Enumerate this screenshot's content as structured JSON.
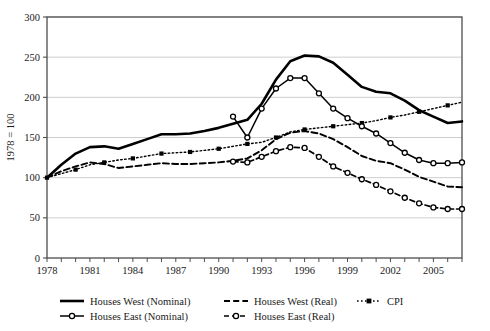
{
  "chart_data": {
    "type": "line",
    "title": "",
    "xlabel": "",
    "ylabel": "1978 = 100",
    "ylim": [
      0,
      300
    ],
    "xlim": [
      1978,
      2007
    ],
    "yticks": [
      0,
      50,
      100,
      150,
      200,
      250,
      300
    ],
    "xticks": [
      1978,
      1981,
      1984,
      1987,
      1990,
      1993,
      1996,
      1999,
      2002,
      2005
    ],
    "xtick_labels": [
      "1978",
      "1981",
      "1984",
      "1987",
      "1990",
      "1993",
      "1996",
      "1999",
      "2002",
      "2005"
    ],
    "ytick_labels": [
      "0",
      "50",
      "100",
      "150",
      "200",
      "250",
      "300"
    ],
    "grid": "horizontal",
    "legend_position": "bottom",
    "series": [
      {
        "name": "Houses West (Nominal)",
        "style": "solid-thick",
        "marker": "none",
        "color": "#000000",
        "x": [
          1978,
          1979,
          1980,
          1981,
          1982,
          1983,
          1984,
          1985,
          1986,
          1987,
          1988,
          1989,
          1990,
          1991,
          1992,
          1993,
          1994,
          1995,
          1996,
          1997,
          1998,
          1999,
          2000,
          2001,
          2002,
          2003,
          2004,
          2005,
          2006,
          2007
        ],
        "values": [
          100,
          116,
          130,
          138,
          139,
          136,
          142,
          148,
          154,
          154,
          155,
          158,
          162,
          167,
          172,
          192,
          222,
          245,
          252,
          251,
          243,
          228,
          213,
          207,
          205,
          196,
          184,
          176,
          168,
          170
        ]
      },
      {
        "name": "Houses West (Real)",
        "style": "dashed",
        "marker": "none",
        "color": "#000000",
        "x": [
          1978,
          1979,
          1980,
          1981,
          1982,
          1983,
          1984,
          1985,
          1986,
          1987,
          1988,
          1989,
          1990,
          1991,
          1992,
          1993,
          1994,
          1995,
          1996,
          1997,
          1998,
          1999,
          2000,
          2001,
          2002,
          2003,
          2004,
          2005,
          2006,
          2007
        ],
        "values": [
          100,
          108,
          114,
          119,
          117,
          112,
          114,
          116,
          118,
          117,
          117,
          118,
          119,
          121,
          124,
          134,
          148,
          156,
          158,
          155,
          148,
          138,
          127,
          121,
          118,
          110,
          101,
          95,
          89,
          88
        ]
      },
      {
        "name": "CPI",
        "style": "dotted",
        "marker": "square",
        "color": "#000000",
        "x": [
          1978,
          1979,
          1980,
          1981,
          1982,
          1983,
          1984,
          1985,
          1986,
          1987,
          1988,
          1989,
          1990,
          1991,
          1992,
          1993,
          1994,
          1995,
          1996,
          1997,
          1998,
          1999,
          2000,
          2001,
          2002,
          2003,
          2004,
          2005,
          2006,
          2007
        ],
        "values": [
          100,
          105,
          110,
          116,
          119,
          122,
          124,
          127,
          130,
          131,
          132,
          134,
          136,
          139,
          142,
          144,
          150,
          157,
          160,
          162,
          164,
          166,
          168,
          171,
          175,
          178,
          182,
          186,
          190,
          194
        ]
      },
      {
        "name": "Houses East (Nominal)",
        "style": "solid-marker",
        "marker": "circle",
        "color": "#000000",
        "x": [
          1991,
          1992,
          1993,
          1994,
          1995,
          1996,
          1997,
          1998,
          1999,
          2000,
          2001,
          2002,
          2003,
          2004,
          2005,
          2006,
          2007
        ],
        "values": [
          176,
          150,
          186,
          211,
          224,
          224,
          205,
          186,
          174,
          164,
          155,
          143,
          131,
          122,
          118,
          118,
          119
        ]
      },
      {
        "name": "Houses East (Real)",
        "style": "dashed-marker",
        "marker": "circle",
        "color": "#000000",
        "x": [
          1991,
          1992,
          1993,
          1994,
          1995,
          1996,
          1997,
          1998,
          1999,
          2000,
          2001,
          2002,
          2003,
          2004,
          2005,
          2006,
          2007
        ],
        "values": [
          120,
          119,
          126,
          133,
          138,
          137,
          126,
          114,
          106,
          98,
          91,
          83,
          75,
          68,
          63,
          61,
          61
        ]
      }
    ]
  },
  "legend": {
    "entries": [
      {
        "label": "Houses West (Nominal)",
        "key": "west-nominal"
      },
      {
        "label": "Houses West (Real)",
        "key": "west-real"
      },
      {
        "label": "CPI",
        "key": "cpi"
      },
      {
        "label": "Houses East (Nominal)",
        "key": "east-nominal"
      },
      {
        "label": "Houses East (Real)",
        "key": "east-real"
      }
    ]
  }
}
